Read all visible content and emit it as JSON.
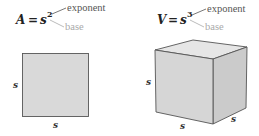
{
  "square": {
    "formula_lhs": "A",
    "equals": "=",
    "base_var": "s",
    "exponent": "2",
    "exponent_label": "exponent",
    "base_label": "base",
    "side_left_label": "s",
    "side_bottom_label": "s"
  },
  "cube": {
    "formula_lhs": "V",
    "equals": "=",
    "base_var": "s",
    "exponent": "3",
    "exponent_label": "exponent",
    "base_label": "base",
    "side_left_label": "s",
    "side_bottom_label": "s",
    "side_right_label": "s"
  },
  "colors": {
    "square_fill": "#d9d9d9",
    "cube_front": "#d6d6d6",
    "cube_top": "#e6e6e6",
    "cube_right": "#cbcbcb",
    "outline": "#555555",
    "leader_exponent": "#555555",
    "leader_base": "#aaaaaa"
  }
}
